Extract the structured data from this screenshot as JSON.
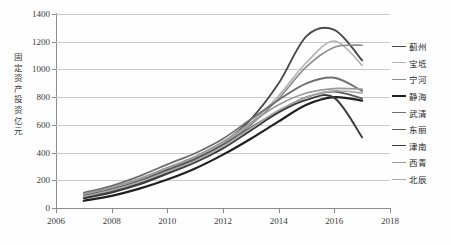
{
  "chart_data": {
    "type": "line",
    "title": "",
    "xlabel": "",
    "ylabel": "固定资产投资 亿元",
    "xlim": [
      2006,
      2018
    ],
    "ylim": [
      0,
      1400
    ],
    "xticks": [
      "2006",
      "2008",
      "2010",
      "2012",
      "2014",
      "2016",
      "2018"
    ],
    "yticks": [
      "0",
      "200",
      "400",
      "600",
      "800",
      "1000",
      "1200",
      "1400"
    ],
    "grid": "horizontal",
    "legend_position": "right",
    "x": [
      2007,
      2008,
      2009,
      2010,
      2011,
      2012,
      2013,
      2014,
      2015,
      2016,
      2017
    ],
    "series": [
      {
        "name": "蓟州",
        "color": "#4a4a4a",
        "width": 1.9,
        "values": [
          78,
          120,
          178,
          255,
          350,
          470,
          640,
          900,
          1240,
          1285,
          1065
        ]
      },
      {
        "name": "宝坻",
        "color": "#b4b4b4",
        "width": 1.7,
        "values": [
          105,
          150,
          205,
          285,
          360,
          470,
          615,
          810,
          1050,
          1205,
          1030
        ]
      },
      {
        "name": "宁河",
        "color": "#8c8c8c",
        "width": 1.6,
        "values": [
          96,
          140,
          196,
          270,
          350,
          460,
          600,
          790,
          1020,
          1160,
          1175
        ]
      },
      {
        "name": "静海",
        "color": "#202020",
        "width": 2.2,
        "values": [
          52,
          88,
          140,
          205,
          285,
          385,
          500,
          625,
          745,
          800,
          775
        ]
      },
      {
        "name": "武清",
        "color": "#6e6e6e",
        "width": 1.8,
        "values": [
          110,
          160,
          230,
          315,
          395,
          500,
          640,
          780,
          900,
          940,
          845
        ]
      },
      {
        "name": "东丽",
        "color": "#5a5a5a",
        "width": 1.8,
        "values": [
          88,
          132,
          195,
          275,
          355,
          455,
          580,
          700,
          800,
          840,
          790
        ]
      },
      {
        "name": "津南",
        "color": "#3c3c3c",
        "width": 1.9,
        "values": [
          70,
          112,
          170,
          248,
          330,
          430,
          560,
          690,
          780,
          795,
          510
        ]
      },
      {
        "name": "西青",
        "color": "#9a9a9a",
        "width": 1.7,
        "values": [
          100,
          148,
          212,
          292,
          372,
          478,
          615,
          745,
          830,
          862,
          858
        ]
      },
      {
        "name": "北辰",
        "color": "#a8a8a8",
        "width": 1.6,
        "values": [
          84,
          128,
          188,
          262,
          340,
          445,
          575,
          705,
          800,
          845,
          830
        ]
      }
    ]
  },
  "legend": {
    "items": [
      {
        "label": "蓟州"
      },
      {
        "label": "宝坻"
      },
      {
        "label": "宁河"
      },
      {
        "label": "静海"
      },
      {
        "label": "武清"
      },
      {
        "label": "东丽"
      },
      {
        "label": "津南"
      },
      {
        "label": "西青"
      },
      {
        "label": "北辰"
      }
    ]
  }
}
